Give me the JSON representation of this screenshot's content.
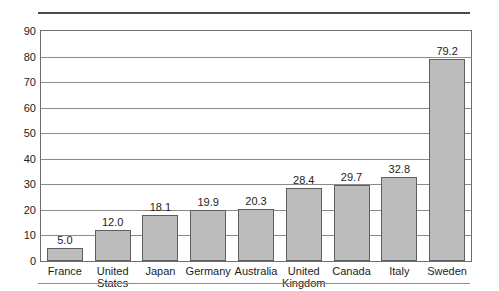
{
  "chart_data": {
    "type": "bar",
    "title": "",
    "subtitle": "",
    "xlabel": "",
    "ylabel": "",
    "categories": [
      "France",
      "United States",
      "Japan",
      "Germany",
      "Australia",
      "United Kingdom",
      "Canada",
      "Italy",
      "Sweden"
    ],
    "category_lines": [
      [
        "France"
      ],
      [
        "United",
        "States"
      ],
      [
        "Japan"
      ],
      [
        "Germany"
      ],
      [
        "Australia"
      ],
      [
        "United",
        "Kingdom"
      ],
      [
        "Canada"
      ],
      [
        "Italy"
      ],
      [
        "Sweden"
      ]
    ],
    "values": [
      5.0,
      12.0,
      18.1,
      19.9,
      20.3,
      28.4,
      29.7,
      32.8,
      79.2
    ],
    "value_labels": [
      "5.0",
      "12.0",
      "18.1",
      "19.9",
      "20.3",
      "28.4",
      "29.7",
      "32.8",
      "79.2"
    ],
    "ylim": [
      0,
      90
    ],
    "ytick_labels": [
      "0",
      "10",
      "20",
      "30",
      "40",
      "50",
      "60",
      "70",
      "80",
      "90"
    ],
    "ytick_values": [
      0,
      10,
      20,
      30,
      40,
      50,
      60,
      70,
      80,
      90
    ],
    "grid": true,
    "grid_axis": "y",
    "legend": false,
    "legend_position": "none",
    "bar_fill_color": "#bcbcbc",
    "bar_edge_color": "#5e5e5e",
    "grid_color": "#8a8a8a",
    "frame_color": "#6f6f6f",
    "text_color": "#1c1c1c",
    "background_color": "#ffffff"
  },
  "decorations": {
    "top_rule_color": "#4a4a4a",
    "bottom_rule_color": "#8d8d8d"
  }
}
